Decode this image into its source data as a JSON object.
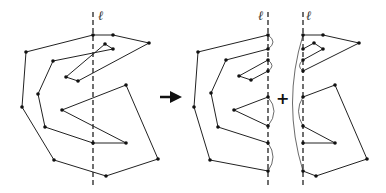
{
  "diagram": {
    "line_label": "ℓ",
    "operator_arrow": "→",
    "operator_plus": "+",
    "colors": {
      "stroke": "#222222",
      "background": "#ffffff"
    },
    "panels": [
      {
        "name": "original-polygon",
        "line_x": 93
      },
      {
        "name": "left-part",
        "line_x": 268
      },
      {
        "name": "right-part",
        "line_x": 303
      }
    ]
  }
}
